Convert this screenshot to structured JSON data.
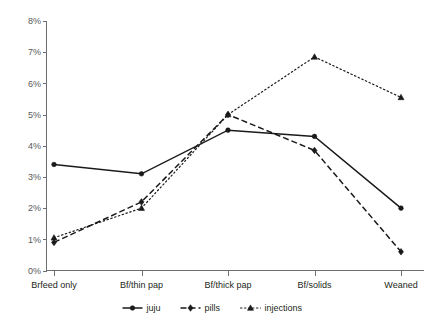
{
  "chart_data": {
    "type": "line",
    "title": "",
    "subtitle": "",
    "xlabel": "",
    "ylabel": "",
    "categories": [
      "Brfeed only",
      "Bf/thin pap",
      "Bf/thick pap",
      "Bf/solids",
      "Weaned"
    ],
    "ylim": [
      0,
      8
    ],
    "ytick_labels": [
      "0%",
      "1%",
      "2%",
      "3%",
      "4%",
      "5%",
      "6%",
      "7%",
      "8%"
    ],
    "ytick_values": [
      0,
      1,
      2,
      3,
      4,
      5,
      6,
      7,
      8
    ],
    "grid": false,
    "legend_position": "bottom",
    "series": [
      {
        "name": "juju",
        "line_style": "solid",
        "marker": "circle",
        "color": "#1a1a1a",
        "values": [
          3.4,
          3.1,
          4.5,
          4.3,
          2.0
        ]
      },
      {
        "name": "pills",
        "line_style": "dashed",
        "marker": "diamond",
        "color": "#1a1a1a",
        "values": [
          0.9,
          2.2,
          5.0,
          3.85,
          0.6
        ]
      },
      {
        "name": "injections",
        "line_style": "dotted",
        "marker": "triangle",
        "color": "#1a1a1a",
        "values": [
          1.05,
          2.0,
          5.0,
          6.85,
          5.55
        ]
      }
    ]
  },
  "legend": {
    "items": [
      {
        "label": "juju"
      },
      {
        "label": "pills"
      },
      {
        "label": "injections"
      }
    ]
  },
  "axis": {
    "y_axis_name": "percent-axis",
    "x_axis_name": "feeding-stage-axis"
  }
}
